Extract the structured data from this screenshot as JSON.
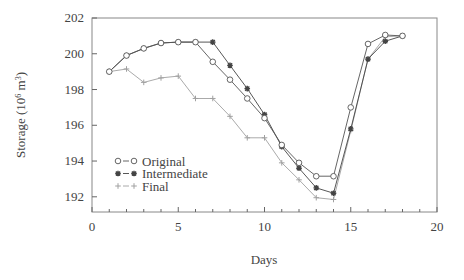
{
  "chart_data": {
    "type": "line",
    "title": "",
    "xlabel": "Days",
    "ylabel": "Storage (10⁶ m³)",
    "ylabel_parts": {
      "base": "Storage (10",
      "sup": "6",
      "mid": " m",
      "sup2": "3",
      "end": ")"
    },
    "xlim": [
      0,
      20
    ],
    "ylim": [
      191.15,
      202
    ],
    "xticks": [
      0,
      5,
      10,
      15,
      20
    ],
    "yticks": [
      192,
      194,
      196,
      198,
      200,
      202
    ],
    "x_minor_step": 1,
    "grid": false,
    "legend_position": "lower-left",
    "x": [
      1,
      2,
      3,
      4,
      5,
      6,
      7,
      8,
      9,
      10,
      11,
      12,
      13,
      14,
      15,
      16,
      17,
      18
    ],
    "series": [
      {
        "name": "Original",
        "marker": "circle",
        "color": "#555555",
        "legend_symbol": "o-o",
        "values": [
          199.0,
          199.9,
          200.3,
          200.6,
          200.65,
          200.65,
          199.55,
          198.55,
          197.5,
          196.4,
          194.9,
          193.9,
          193.15,
          193.15,
          197.0,
          200.55,
          201.05,
          201.0
        ]
      },
      {
        "name": "Intermediate",
        "marker": "asterisk",
        "color": "#444444",
        "legend_symbol": "*-*",
        "values": [
          199.0,
          199.9,
          200.3,
          200.6,
          200.65,
          200.65,
          200.65,
          199.35,
          198.05,
          196.6,
          194.8,
          193.6,
          192.5,
          192.2,
          195.8,
          199.7,
          200.7,
          201.0
        ]
      },
      {
        "name": "Final",
        "marker": "plus",
        "color": "#a0a0a0",
        "legend_symbol": "+-+",
        "values": [
          199.0,
          199.15,
          198.4,
          198.65,
          198.75,
          197.5,
          197.5,
          196.5,
          195.3,
          195.3,
          193.9,
          192.95,
          191.95,
          191.85,
          195.7,
          199.7,
          200.95,
          201.0
        ]
      }
    ]
  },
  "layout": {
    "plot_left": 92,
    "plot_right": 437,
    "plot_top": 18,
    "plot_bottom": 212
  }
}
